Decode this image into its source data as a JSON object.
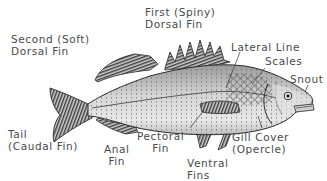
{
  "diagram": {
    "labels": {
      "second_dorsal_fin": [
        "Second (Soft)",
        "Dorsal Fin"
      ],
      "first_dorsal_fin": [
        "First (Spiny)",
        "Dorsal Fin"
      ],
      "lateral_line": "Lateral Line",
      "scales": "Scales",
      "snout": "Snout",
      "tail": [
        "Tail",
        "(Caudal Fin)"
      ],
      "anal_fin": [
        "Anal",
        "Fin"
      ],
      "pectoral_fin": [
        "Pectoral",
        "Fin"
      ],
      "ventral_fins": [
        "Ventral",
        "Fins"
      ],
      "gill_cover": [
        "Gill Cover",
        "(Opercle)"
      ]
    },
    "colors": {
      "label_text": "#4a4a4a",
      "body_fill": "#d9d9d9",
      "outline": "#2a2a2a",
      "fin_fill": "#8a8a8a",
      "background": "#ffffff"
    }
  }
}
